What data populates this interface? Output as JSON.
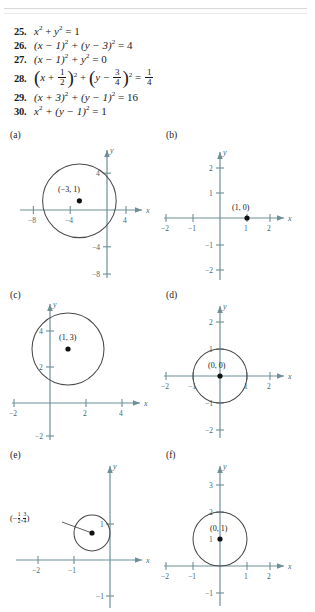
{
  "exercises": [
    {
      "number": "25.",
      "latex_plain": "x^2 + y^2 = 1"
    },
    {
      "number": "26.",
      "latex_plain": "(x - 1)^2 + (y - 3)^2 = 4"
    },
    {
      "number": "27.",
      "latex_plain": "(x - 1)^2 + y^2 = 0"
    },
    {
      "number": "28.",
      "latex_plain": "(x + 1/2)^2 + (y - 3/4)^2 = 1/4"
    },
    {
      "number": "29.",
      "latex_plain": "(x + 3)^2 + (y - 1)^2 = 16"
    },
    {
      "number": "30.",
      "latex_plain": "x^2 + (y - 1)^2 = 1"
    }
  ],
  "eq25": {
    "num": "25.",
    "v": "x",
    "p1": "2",
    "plus": "+",
    "y": "y",
    "p2": "2",
    "eqsign": "= 1"
  },
  "eq26": {
    "num": "26.",
    "lhs": "(x − 1)",
    "e1": "2",
    "mid": "+ (y − 3)",
    "e2": "2",
    "rhs": "= 4"
  },
  "eq27": {
    "num": "27.",
    "lhs": "(x − 1)",
    "e1": "2",
    "mid": "+ y",
    "e2": "2",
    "rhs": "= 0"
  },
  "eq28": {
    "num": "28.",
    "x": "x",
    "plus": "+",
    "n1": "1",
    "d1": "2",
    "e1": "2",
    "mid": "+",
    "y": "y",
    "minus": "−",
    "n2": "3",
    "d2": "4",
    "e2": "2",
    "eqsign": "=",
    "n3": "1",
    "d3": "4"
  },
  "eq29": {
    "num": "29.",
    "lhs": "(x + 3)",
    "e1": "2",
    "mid": "+ (y − 1)",
    "e2": "2",
    "rhs": "= 16"
  },
  "eq30": {
    "num": "30.",
    "lhs": "x",
    "e1": "2",
    "mid": "+ (y − 1)",
    "e2": "2",
    "rhs": "= 1"
  },
  "graphs": [
    {
      "tag": "(a)",
      "x_axis_label": "x",
      "y_axis_label": "y",
      "center_label": "(−3, 1)",
      "center": [
        -3,
        1
      ],
      "radius": 4,
      "has_circle": true,
      "x_ticks": [
        "−8",
        "−4",
        "4"
      ],
      "y_ticks": [
        "4",
        "−4",
        "−8"
      ]
    },
    {
      "tag": "(b)",
      "x_axis_label": "x",
      "y_axis_label": "y",
      "center_label": "(1, 0)",
      "center": [
        1,
        0
      ],
      "radius": 0,
      "has_circle": false,
      "x_ticks": [
        "−2",
        "−1",
        "1",
        "2"
      ],
      "y_ticks": [
        "2",
        "1",
        "−1",
        "−2"
      ]
    },
    {
      "tag": "(c)",
      "x_axis_label": "x",
      "y_axis_label": "y",
      "center_label": "(1, 3)",
      "center": [
        1,
        3
      ],
      "radius": 2,
      "has_circle": true,
      "x_ticks": [
        "−2",
        "2",
        "4"
      ],
      "y_ticks": [
        "4",
        "2",
        "−2"
      ]
    },
    {
      "tag": "(d)",
      "x_axis_label": "x",
      "y_axis_label": "y",
      "center_label": "(0, 0)",
      "center": [
        0,
        0
      ],
      "radius": 1,
      "has_circle": true,
      "x_ticks": [
        "−2",
        "−1",
        "1",
        "2"
      ],
      "y_ticks": [
        "2",
        "1",
        "−1",
        "−2"
      ]
    },
    {
      "tag": "(e)",
      "x_axis_label": "x",
      "y_axis_label": "y",
      "center_label": "(− 1/2 , 3/4 )",
      "center": [
        -0.5,
        0.75
      ],
      "radius": 0.5,
      "has_circle": true,
      "has_leader_line": true,
      "x_ticks": [
        "−2",
        "−1"
      ],
      "y_ticks": [
        "1",
        "−1"
      ]
    },
    {
      "tag": "(f)",
      "x_axis_label": "x",
      "y_axis_label": "y",
      "center_label": "(0, 1)",
      "center": [
        0,
        1
      ],
      "radius": 1,
      "has_circle": true,
      "x_ticks": [
        "−2",
        "−1",
        "1",
        "2"
      ],
      "y_ticks": [
        "3",
        "2",
        "1",
        "−1"
      ]
    }
  ],
  "labels": {
    "e_frac1_num": "1",
    "e_frac1_den": "2",
    "e_frac2_num": "3",
    "e_frac2_den": "4",
    "e_open": "(−",
    "e_comma": ",",
    "e_close": ")",
    "f_one": "1"
  },
  "colors": {
    "axis": "#6e8f98",
    "circle": "#4a4a4a",
    "tick_text": "#46636b",
    "body_text": "#1a1a1a",
    "rule": "#d8d8d8"
  }
}
